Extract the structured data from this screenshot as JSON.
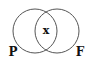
{
  "diagram": {
    "type": "venn",
    "sets": [
      {
        "label": "P",
        "cx": 35,
        "cy": 31,
        "r": 22
      },
      {
        "label": "F",
        "cx": 57,
        "cy": 31,
        "r": 22
      }
    ],
    "intersection_label": "x",
    "stroke_color": "#555555",
    "text_color": "#111111"
  }
}
